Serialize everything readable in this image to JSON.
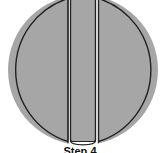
{
  "diagram": {
    "fill_color": "#a6a6a6",
    "stroke_color": "#222222",
    "gap_color": "#ffffff",
    "pieces": [
      {
        "name": "left-segment"
      },
      {
        "name": "center-strip"
      },
      {
        "name": "right-segment"
      }
    ]
  },
  "caption": "Step 4"
}
